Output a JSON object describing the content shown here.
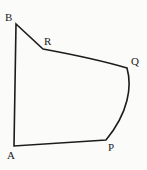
{
  "figure": {
    "kind": "plane-geometry-diagram",
    "background_color": "#fbfbf9",
    "stroke_color": "#1c1c1c",
    "stroke_width": 1.6,
    "canvas": {
      "width": 147,
      "height": 170
    },
    "labels": {
      "a": "A",
      "b": "B",
      "p": "P",
      "q": "Q",
      "r": "R"
    },
    "vertices": [
      {
        "name": "A",
        "x": 14,
        "y": 146
      },
      {
        "name": "B",
        "x": 16,
        "y": 24
      },
      {
        "name": "R",
        "x": 43,
        "y": 49
      },
      {
        "name": "Q",
        "x": 127,
        "y": 68
      },
      {
        "name": "P",
        "x": 106,
        "y": 140
      }
    ],
    "edges": [
      {
        "name": "A-B",
        "from": "A",
        "to": "B",
        "type": "line"
      },
      {
        "name": "B-R",
        "from": "B",
        "to": "R",
        "type": "line"
      },
      {
        "name": "R-Q",
        "from": "R",
        "to": "Q",
        "type": "slight-curve"
      },
      {
        "name": "Q-P",
        "from": "Q",
        "to": "P",
        "type": "curve"
      },
      {
        "name": "P-A",
        "from": "P",
        "to": "A",
        "type": "line"
      }
    ],
    "outline_path": "M 14 146 L 16 24 L 43 49 C 70 54 100 60 127 68 C 132 86 129 112 106 140 Z"
  }
}
